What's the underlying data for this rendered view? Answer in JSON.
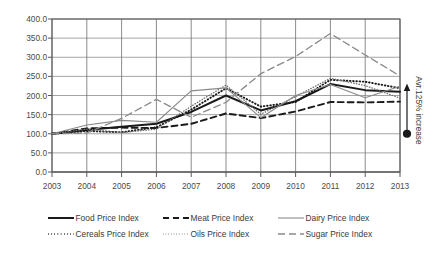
{
  "chart_data": {
    "type": "line",
    "title": "",
    "xlabel": "",
    "ylabel": "",
    "x": [
      2003,
      2004,
      2005,
      2006,
      2007,
      2008,
      2009,
      2010,
      2011,
      2012,
      2013
    ],
    "xticklabels": [
      "2003",
      "2004",
      "2005",
      "2006",
      "2007",
      "2008",
      "2009",
      "2010",
      "2011",
      "2012",
      "2013"
    ],
    "yticklabels": [
      "0.0",
      "50.0",
      "100.0",
      "150.0",
      "200.0",
      "250.0",
      "300.0",
      "350.0",
      "400.0"
    ],
    "yticks": [
      0,
      50,
      100,
      150,
      200,
      250,
      300,
      350,
      400
    ],
    "ylim": [
      0,
      400
    ],
    "grid": true,
    "legend_position": "below",
    "series": [
      {
        "name": "Food Price Index",
        "style": "solid-thick",
        "color": "#1a1a1a",
        "values": [
          100,
          110,
          118,
          126,
          157,
          200,
          161,
          185,
          230,
          214,
          210
        ]
      },
      {
        "name": "Cereals Price Index",
        "style": "dotted",
        "color": "#1a1a1a",
        "values": [
          100,
          107,
          104,
          117,
          163,
          219,
          171,
          183,
          241,
          236,
          219
        ]
      },
      {
        "name": "Meat Price Index",
        "style": "dashed-thick",
        "color": "#1a1a1a",
        "values": [
          100,
          114,
          116,
          115,
          126,
          153,
          141,
          158,
          183,
          182,
          184
        ]
      },
      {
        "name": "Oils Price Index",
        "style": "dotted-fine",
        "color": "#6e6e6e",
        "values": [
          100,
          112,
          103,
          112,
          172,
          227,
          151,
          197,
          245,
          226,
          193
        ]
      },
      {
        "name": "Dairy Price Index",
        "style": "solid-thin",
        "color": "#8a8a8a",
        "values": [
          100,
          123,
          135,
          130,
          212,
          220,
          142,
          200,
          229,
          194,
          224
        ]
      },
      {
        "name": "Sugar Price Index",
        "style": "dashed-long",
        "color": "#8a8a8a",
        "values": [
          100,
          102,
          140,
          190,
          143,
          182,
          257,
          302,
          362,
          306,
          251
        ]
      }
    ],
    "annotations": [
      {
        "text": "Avr.125% increase",
        "type": "vertical-arrow-label",
        "at_x": 2013,
        "from_value": 100,
        "to_value": 222
      }
    ],
    "markers": [
      {
        "type": "filled-dot",
        "x": 2013,
        "value": 100
      }
    ]
  },
  "legend": {
    "entries": [
      {
        "label": "Food Price Index"
      },
      {
        "label": "Meat Price Index"
      },
      {
        "label": "Dairy Price Index"
      },
      {
        "label": "Cereals Price Index"
      },
      {
        "label": "Oils Price Index"
      },
      {
        "label": "Sugar Price Index"
      }
    ]
  }
}
